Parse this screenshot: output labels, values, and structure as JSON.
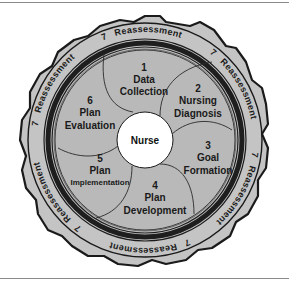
{
  "diagram": {
    "center": {
      "label": "Nurse"
    },
    "segments": [
      {
        "number": "1",
        "line1": "Data",
        "line2": "Collection"
      },
      {
        "number": "2",
        "line1": "Nursing",
        "line2": "Diagnosis"
      },
      {
        "number": "3",
        "line1": "Goal",
        "line2": "Formation"
      },
      {
        "number": "4",
        "line1": "Plan",
        "line2": "Development"
      },
      {
        "number": "5",
        "line1": "Plan",
        "line2": "Implementation"
      },
      {
        "number": "6",
        "line1": "Plan",
        "line2": "Evaluation"
      }
    ],
    "outer_ring": {
      "number": "7",
      "label": "Reassessment",
      "repeat_count": 6
    },
    "colors": {
      "segment_fill": "#b9b9b9",
      "ring_fill": "#c4c4c4",
      "dark_band": "#1e1e1e",
      "center_fill": "#ffffff",
      "outline": "#1a1a1a"
    }
  }
}
